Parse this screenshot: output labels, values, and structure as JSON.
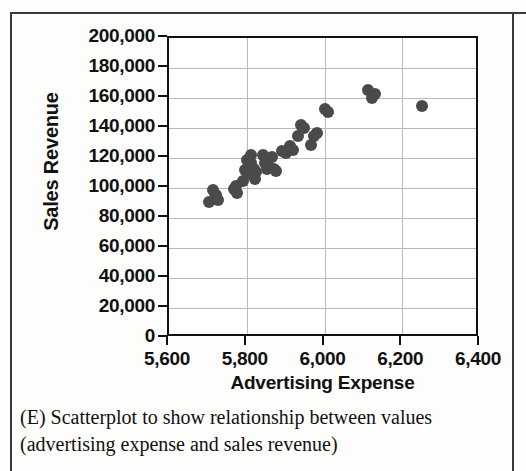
{
  "figure": {
    "caption_line1": "(E) Scatterplot to show relationship between",
    "caption_line2": "values (advertising expense and sales revenue)",
    "label": "(E)"
  },
  "chart_data": {
    "type": "scatter",
    "title": "",
    "xlabel": "Advertising Expense",
    "ylabel": "Sales Revenue",
    "xlim": [
      5600,
      6400
    ],
    "ylim": [
      0,
      200000
    ],
    "xticks": [
      5600,
      5800,
      6000,
      6200,
      6400
    ],
    "xtick_labels": [
      "5,600",
      "5,800",
      "6,000",
      "6,200",
      "6,400"
    ],
    "yticks": [
      0,
      20000,
      40000,
      60000,
      80000,
      100000,
      120000,
      140000,
      160000,
      180000,
      200000
    ],
    "ytick_labels": [
      "0",
      "20,000",
      "40,000",
      "60,000",
      "80,000",
      "100,000",
      "120,000",
      "140,000",
      "160,000",
      "180,000",
      "200,000"
    ],
    "grid": true,
    "legend": null,
    "marker_color": "#4a4a4a",
    "points": [
      {
        "x": 5703,
        "y": 90500
      },
      {
        "x": 5712,
        "y": 99000
      },
      {
        "x": 5719,
        "y": 93500
      },
      {
        "x": 5722,
        "y": 95500
      },
      {
        "x": 5726,
        "y": 92000
      },
      {
        "x": 5768,
        "y": 99500
      },
      {
        "x": 5772,
        "y": 101500
      },
      {
        "x": 5776,
        "y": 96500
      },
      {
        "x": 5790,
        "y": 105000
      },
      {
        "x": 5796,
        "y": 112000
      },
      {
        "x": 5800,
        "y": 118500
      },
      {
        "x": 5802,
        "y": 110000
      },
      {
        "x": 5806,
        "y": 113500
      },
      {
        "x": 5810,
        "y": 122000
      },
      {
        "x": 5812,
        "y": 117000
      },
      {
        "x": 5815,
        "y": 108500
      },
      {
        "x": 5818,
        "y": 112500
      },
      {
        "x": 5821,
        "y": 106000
      },
      {
        "x": 5824,
        "y": 110500
      },
      {
        "x": 5842,
        "y": 122000
      },
      {
        "x": 5846,
        "y": 116500
      },
      {
        "x": 5852,
        "y": 113000
      },
      {
        "x": 5856,
        "y": 114000
      },
      {
        "x": 5864,
        "y": 120500
      },
      {
        "x": 5869,
        "y": 112500
      },
      {
        "x": 5876,
        "y": 111500
      },
      {
        "x": 5890,
        "y": 124500
      },
      {
        "x": 5900,
        "y": 123500
      },
      {
        "x": 5912,
        "y": 128000
      },
      {
        "x": 5918,
        "y": 125500
      },
      {
        "x": 5932,
        "y": 134500
      },
      {
        "x": 5940,
        "y": 142000
      },
      {
        "x": 5948,
        "y": 140000
      },
      {
        "x": 5966,
        "y": 128500
      },
      {
        "x": 5972,
        "y": 135000
      },
      {
        "x": 5980,
        "y": 137000
      },
      {
        "x": 6002,
        "y": 153000
      },
      {
        "x": 6010,
        "y": 150500
      },
      {
        "x": 6112,
        "y": 165500
      },
      {
        "x": 6122,
        "y": 160000
      },
      {
        "x": 6130,
        "y": 162500
      },
      {
        "x": 6252,
        "y": 154500
      }
    ]
  }
}
